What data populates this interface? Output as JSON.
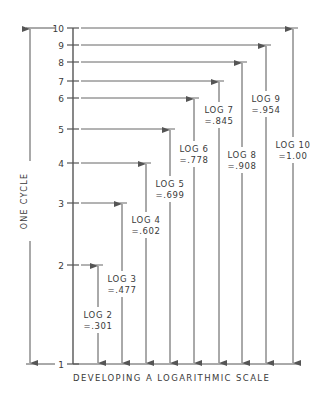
{
  "diagram": {
    "caption": "DEVELOPING A LOGARITHMIC SCALE",
    "side_label": "ONE CYCLE",
    "colors": {
      "line": "#555555",
      "text": "#3a3a3a",
      "background": "#ffffff"
    },
    "axis": {
      "x": 73,
      "baseline_y": 364,
      "baseline_end_x": 298,
      "ticks": [
        {
          "label": "1",
          "y": 364
        },
        {
          "label": "2",
          "y": 265
        },
        {
          "label": "3",
          "y": 203
        },
        {
          "label": "4",
          "y": 163
        },
        {
          "label": "5",
          "y": 129
        },
        {
          "label": "6",
          "y": 98
        },
        {
          "label": "7",
          "y": 81
        },
        {
          "label": "8",
          "y": 62
        },
        {
          "label": "9",
          "y": 45
        },
        {
          "label": "10",
          "y": 28
        }
      ]
    },
    "cycle_arrow": {
      "x": 30,
      "top_y": 28,
      "bottom_y": 364
    },
    "logs": [
      {
        "name": "LOG 2",
        "value": "=.301",
        "x": 98,
        "top_y": 265,
        "label_y": 318
      },
      {
        "name": "LOG 3",
        "value": "=.477",
        "x": 122,
        "top_y": 203,
        "label_y": 282
      },
      {
        "name": "LOG 4",
        "value": "=.602",
        "x": 146,
        "top_y": 163,
        "label_y": 223
      },
      {
        "name": "LOG 5",
        "value": "=.699",
        "x": 170,
        "top_y": 129,
        "label_y": 187
      },
      {
        "name": "LOG 6",
        "value": "=.778",
        "x": 194,
        "top_y": 98,
        "label_y": 152
      },
      {
        "name": "LOG 7",
        "value": "=.845",
        "x": 219,
        "top_y": 81,
        "label_y": 113
      },
      {
        "name": "LOG 8",
        "value": "=.908",
        "x": 242,
        "top_y": 62,
        "label_y": 158
      },
      {
        "name": "LOG 9",
        "value": "=.954",
        "x": 266,
        "top_y": 45,
        "label_y": 102
      },
      {
        "name": "LOG 10",
        "value": "=1.00",
        "x": 293,
        "top_y": 28,
        "label_y": 148
      }
    ]
  }
}
